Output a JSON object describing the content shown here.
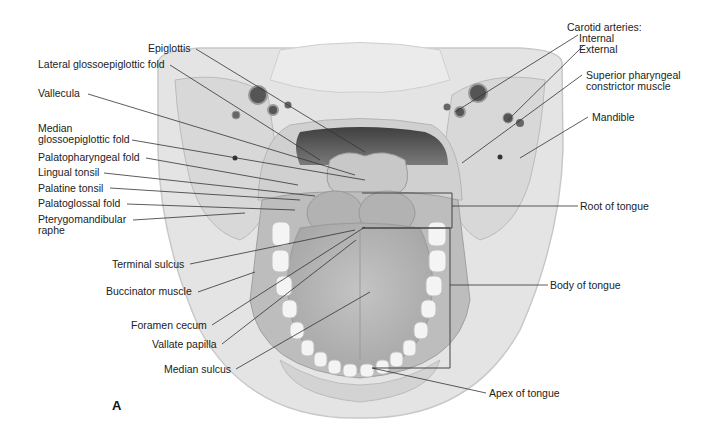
{
  "figure": {
    "panel_label": "A",
    "colors": {
      "background": "#ffffff",
      "tissue_light": "#e6e6e6",
      "tissue_mid": "#cfcfcf",
      "tissue_dark": "#9a9a9a",
      "pharynx_cavity": "#5a5a5a",
      "teeth": "#f4f4f4",
      "leader_line": "#333333",
      "label_text": "#222222"
    }
  },
  "labels_left": [
    {
      "id": "epiglottis",
      "text": "Epiglottis"
    },
    {
      "id": "lateral-glossoepiglottic-fold",
      "text": "Lateral glossoepiglottic fold"
    },
    {
      "id": "vallecula",
      "text": "Vallecula"
    },
    {
      "id": "median-glossoepiglottic-fold",
      "line1": "Median",
      "line2": "glossoepiglottic fold"
    },
    {
      "id": "palatopharyngeal-fold",
      "text": "Palatopharyngeal fold"
    },
    {
      "id": "lingual-tonsil",
      "text": "Lingual tonsil"
    },
    {
      "id": "palatine-tonsil",
      "text": "Palatine tonsil"
    },
    {
      "id": "palatoglossal-fold",
      "text": "Palatoglossal fold"
    },
    {
      "id": "pterygomandibular-raphe",
      "line1": "Pterygomandibular",
      "line2": "raphe"
    },
    {
      "id": "terminal-sulcus",
      "text": "Terminal sulcus"
    },
    {
      "id": "buccinator-muscle",
      "text": "Buccinator muscle"
    },
    {
      "id": "foramen-cecum",
      "text": "Foramen cecum"
    },
    {
      "id": "vallate-papilla",
      "text": "Vallate papilla"
    },
    {
      "id": "median-sulcus",
      "text": "Median sulcus"
    }
  ],
  "labels_right": [
    {
      "id": "carotid-arteries",
      "heading": "Carotid arteries:",
      "line1": "Internal",
      "line2": "External"
    },
    {
      "id": "superior-pharyngeal-constrictor",
      "line1": "Superior pharyngeal",
      "line2": "constrictor muscle"
    },
    {
      "id": "mandible",
      "text": "Mandible"
    },
    {
      "id": "root-of-tongue",
      "text": "Root of tongue"
    },
    {
      "id": "body-of-tongue",
      "text": "Body of tongue"
    },
    {
      "id": "apex-of-tongue",
      "text": "Apex of tongue"
    }
  ]
}
